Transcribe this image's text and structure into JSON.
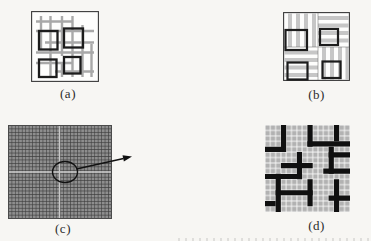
{
  "figure": {
    "type": "four-panel-scanned-figure",
    "panels": [
      {
        "id": "a",
        "caption": "(a)"
      },
      {
        "id": "b",
        "caption": "(b)"
      },
      {
        "id": "c",
        "caption": "(c)"
      },
      {
        "id": "d",
        "caption": "(d)"
      }
    ],
    "icons": [
      "magnifier-circle-icon",
      "zoom-arrow-icon"
    ],
    "colors": {
      "paper": "#f7f6f3",
      "thin_outline": "#3a3a3a",
      "grid_gray": "#a8a8a8",
      "stripe_gray": "#c6c6c6",
      "block_border_black": "#1c1c1c",
      "fine_grid_line": "#3b3b3b",
      "fine_grid_cell": "#8e8e8e",
      "seam_light": "#c8c8c8",
      "coarse_cell_gray": "#b2b2b2",
      "partition_black": "#101010"
    }
  }
}
